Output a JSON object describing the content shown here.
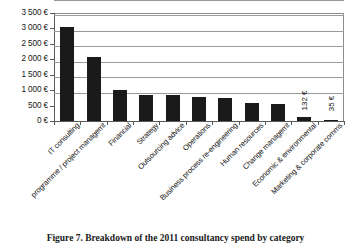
{
  "caption": "Figure 7. Breakdown of the 2011 consultancy spend by category",
  "chart_data": {
    "type": "bar",
    "title": "",
    "xlabel": "",
    "ylabel": "",
    "currency_symbol": "€",
    "ylim": [
      0,
      3500
    ],
    "ytick_values": [
      0,
      500,
      1000,
      1500,
      2000,
      2500,
      3000,
      3500
    ],
    "ytick_labels": [
      "0 €",
      "500 €",
      "1 000 €",
      "1 500 €",
      "2 000 €",
      "2 500 €",
      "3 000 €",
      "3 500 €"
    ],
    "grid": true,
    "legend": false,
    "bar_color": "#1a1a1a",
    "categories": [
      "IT consulting",
      "programme / project managemt",
      "Financial",
      "Strategy",
      "Outsourcing advice",
      "Operations",
      "Business process re-engineering",
      "Human resources",
      "Change managemt",
      "Economic & environmental",
      "Marketing & corporate comms"
    ],
    "values": [
      3050,
      2080,
      1010,
      850,
      830,
      790,
      760,
      590,
      540,
      132,
      35
    ],
    "point_labels": [
      "",
      "",
      "",
      "",
      "",
      "",
      "",
      "",
      "",
      "132 €",
      "35 €"
    ]
  }
}
